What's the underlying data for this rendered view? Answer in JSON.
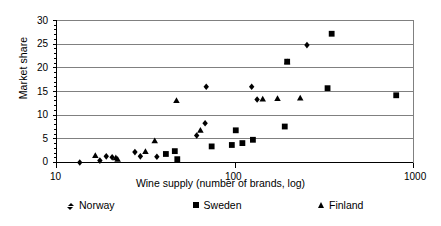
{
  "chart_data": {
    "type": "scatter",
    "title": "",
    "xlabel": "Wine supply (number of brands, log)",
    "ylabel": "Market share",
    "xscale": "log",
    "xlim": [
      10,
      1000
    ],
    "ylim": [
      0,
      30
    ],
    "xticks": [
      10,
      100,
      1000
    ],
    "xtick_labels": [
      "10",
      "100",
      "1000"
    ],
    "yticks": [
      0,
      5,
      10,
      15,
      20,
      25,
      30
    ],
    "ytick_labels": [
      "0",
      "5",
      "10",
      "15",
      "20",
      "25",
      "30"
    ],
    "grid": "horizontal",
    "legend_position": "bottom",
    "series": [
      {
        "name": "Norway",
        "marker": "diamond",
        "color": "#000000",
        "points": [
          {
            "x": 13.5,
            "y": 0.0
          },
          {
            "x": 17.5,
            "y": 0.4
          },
          {
            "x": 19.0,
            "y": 1.3
          },
          {
            "x": 20.5,
            "y": 1.1
          },
          {
            "x": 27.5,
            "y": 2.2
          },
          {
            "x": 29.5,
            "y": 1.3
          },
          {
            "x": 36.5,
            "y": 1.2
          },
          {
            "x": 61.0,
            "y": 5.7
          },
          {
            "x": 68.0,
            "y": 8.3
          },
          {
            "x": 69.0,
            "y": 16.0
          },
          {
            "x": 124.0,
            "y": 16.0
          },
          {
            "x": 133.0,
            "y": 13.3
          },
          {
            "x": 253.0,
            "y": 24.8
          }
        ]
      },
      {
        "name": "Sweden",
        "marker": "square",
        "color": "#000000",
        "points": [
          {
            "x": 41.0,
            "y": 1.8
          },
          {
            "x": 46.0,
            "y": 2.4
          },
          {
            "x": 47.5,
            "y": 0.7
          },
          {
            "x": 74.0,
            "y": 3.4
          },
          {
            "x": 96.0,
            "y": 3.7
          },
          {
            "x": 101.0,
            "y": 6.8
          },
          {
            "x": 110.0,
            "y": 4.1
          },
          {
            "x": 126.0,
            "y": 4.8
          },
          {
            "x": 190.0,
            "y": 7.6
          },
          {
            "x": 196.0,
            "y": 21.3
          },
          {
            "x": 330.0,
            "y": 15.7
          },
          {
            "x": 348.0,
            "y": 27.2
          },
          {
            "x": 800.0,
            "y": 14.2
          }
        ]
      },
      {
        "name": "Finland",
        "marker": "triangle",
        "color": "#000000",
        "points": [
          {
            "x": 16.5,
            "y": 1.5
          },
          {
            "x": 21.5,
            "y": 1.0
          },
          {
            "x": 22.0,
            "y": 0.7
          },
          {
            "x": 31.5,
            "y": 2.3
          },
          {
            "x": 35.5,
            "y": 4.6
          },
          {
            "x": 47.0,
            "y": 13.1
          },
          {
            "x": 64.0,
            "y": 6.8
          },
          {
            "x": 143.0,
            "y": 13.4
          },
          {
            "x": 173.0,
            "y": 13.5
          },
          {
            "x": 232.0,
            "y": 13.6
          },
          {
            "x": 196.0,
            "y": 21.3
          }
        ]
      }
    ]
  },
  "axis": {
    "y_title": "Market share",
    "x_title": "Wine supply (number of brands, log)",
    "y_labels": [
      "30",
      "25",
      "20",
      "15",
      "10",
      "5",
      "0"
    ],
    "x_labels": [
      "10",
      "100",
      "1000"
    ]
  },
  "legend": {
    "entries": [
      {
        "label": "Norway",
        "marker": "diamond-marker"
      },
      {
        "label": "Sweden",
        "marker": "square-marker"
      },
      {
        "label": "Finland",
        "marker": "triangle-marker"
      }
    ]
  },
  "colors": {
    "axis": "#000000",
    "grid": "#808080",
    "marker": "#000000",
    "background": "#ffffff"
  }
}
